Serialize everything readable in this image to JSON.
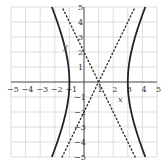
{
  "chart_data": {
    "type": "line",
    "title": "",
    "xlabel": "x",
    "ylabel": "y",
    "xlim": [
      -5,
      5
    ],
    "ylim": [
      -5,
      5
    ],
    "grid": true,
    "x_ticks": [
      "-5",
      "-4",
      "-3",
      "-2",
      "-1",
      "1",
      "2",
      "3",
      "4",
      "5"
    ],
    "y_ticks": [
      "5",
      "4",
      "3",
      "2",
      "1",
      "-1",
      "-2",
      "-3",
      "-4",
      "-5"
    ],
    "series": [
      {
        "name": "hyperbola",
        "equation": "(x-1)^2/4 - y^2/16 = 1",
        "style": "solid",
        "center": [
          1,
          0
        ],
        "vertices": [
          [
            -1,
            0
          ],
          [
            3,
            0
          ]
        ]
      },
      {
        "name": "asymptote-1",
        "equation": "y = 2(x-1)",
        "style": "dotted"
      },
      {
        "name": "asymptote-2",
        "equation": "y = -2(x-1)",
        "style": "dotted"
      }
    ]
  },
  "labels": {
    "x": "x",
    "y": "y"
  }
}
